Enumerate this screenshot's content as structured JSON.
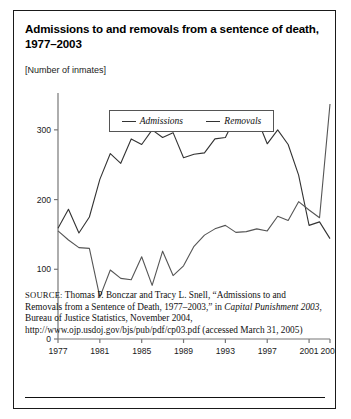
{
  "figure": {
    "title": "Admissions to and removals from a sentence of death, 1977–2003",
    "subtitle": "[Number of inmates]"
  },
  "legend": {
    "position": "top-center-inside",
    "items": [
      {
        "label": "Admissions",
        "color": "#333333"
      },
      {
        "label": "Removals",
        "color": "#555555"
      }
    ]
  },
  "source": {
    "label": "SOURCE:",
    "text_part1": " Thomas P. Bonczar and Tracy L. Snell, “Admissions to and Removals from a Sentence of Death, 1977–2003,” in ",
    "text_italic1": "Capital Punishment 2003",
    "text_part2": ", Bureau of Justice Statistics, November 2004, http://www.ojp.usdoj.gov/bjs/pub/pdf/cp03.pdf (accessed March 31, 2005)"
  },
  "chart_data": {
    "type": "line",
    "title": "Admissions to and removals from a sentence of death, 1977–2003",
    "subtitle": "[Number of inmates]",
    "xlabel": "",
    "ylabel": "Number of inmates",
    "xlim": [
      1977,
      2003
    ],
    "ylim": [
      0,
      350
    ],
    "yticks": [
      0,
      100,
      200,
      300
    ],
    "ytick_labels": [
      "0",
      "100",
      "200",
      "300"
    ],
    "xticks": [
      1977,
      1981,
      1985,
      1989,
      1993,
      1997,
      2001,
      2003
    ],
    "xtick_labels": [
      "1977",
      "1981",
      "1985",
      "1989",
      "1993",
      "1997",
      "2001",
      "2003"
    ],
    "grid": false,
    "legend": [
      "Admissions",
      "Removals"
    ],
    "x": [
      1977,
      1978,
      1979,
      1980,
      1981,
      1982,
      1983,
      1984,
      1985,
      1986,
      1987,
      1988,
      1989,
      1990,
      1991,
      1992,
      1993,
      1994,
      1995,
      1996,
      1997,
      1998,
      1999,
      2000,
      2001,
      2002,
      2003
    ],
    "series": [
      {
        "name": "Admissions",
        "color": "#333333",
        "values": [
          159,
          186,
          152,
          175,
          229,
          266,
          252,
          287,
          279,
          300,
          289,
          296,
          260,
          265,
          267,
          287,
          289,
          320,
          318,
          317,
          280,
          300,
          279,
          235,
          163,
          168,
          144
        ]
      },
      {
        "name": "Removals",
        "color": "#555555",
        "values": [
          155,
          142,
          131,
          130,
          60,
          99,
          87,
          85,
          118,
          77,
          126,
          91,
          105,
          133,
          149,
          158,
          163,
          153,
          154,
          158,
          155,
          176,
          170,
          197,
          185,
          174,
          337
        ]
      }
    ]
  }
}
